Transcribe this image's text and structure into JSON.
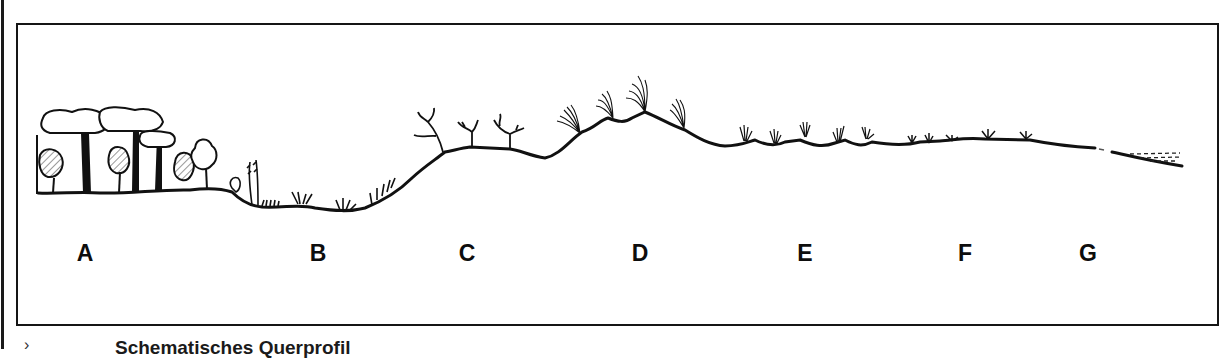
{
  "figure": {
    "title": "Schematisches Querprofil",
    "caption_marker": "›",
    "zones": [
      {
        "id": "A",
        "label": "A",
        "x": 85,
        "vegetation": "forest-trees"
      },
      {
        "id": "B",
        "label": "B",
        "x": 318,
        "vegetation": "reeds-and-low-shrubs-in-hollow"
      },
      {
        "id": "C",
        "label": "C",
        "x": 467,
        "vegetation": "branching-shrubs-on-slope"
      },
      {
        "id": "D",
        "label": "D",
        "x": 640,
        "vegetation": "tall-grass-tussocks-on-ridge"
      },
      {
        "id": "E",
        "label": "E",
        "x": 805,
        "vegetation": "grass-tufts-undulating"
      },
      {
        "id": "F",
        "label": "F",
        "x": 965,
        "vegetation": "low-rosette-plants"
      },
      {
        "id": "G",
        "label": "G",
        "x": 1088,
        "vegetation": "bare-shore-and-water"
      }
    ],
    "colors": {
      "ink": "#111111",
      "background": "#ffffff"
    }
  }
}
